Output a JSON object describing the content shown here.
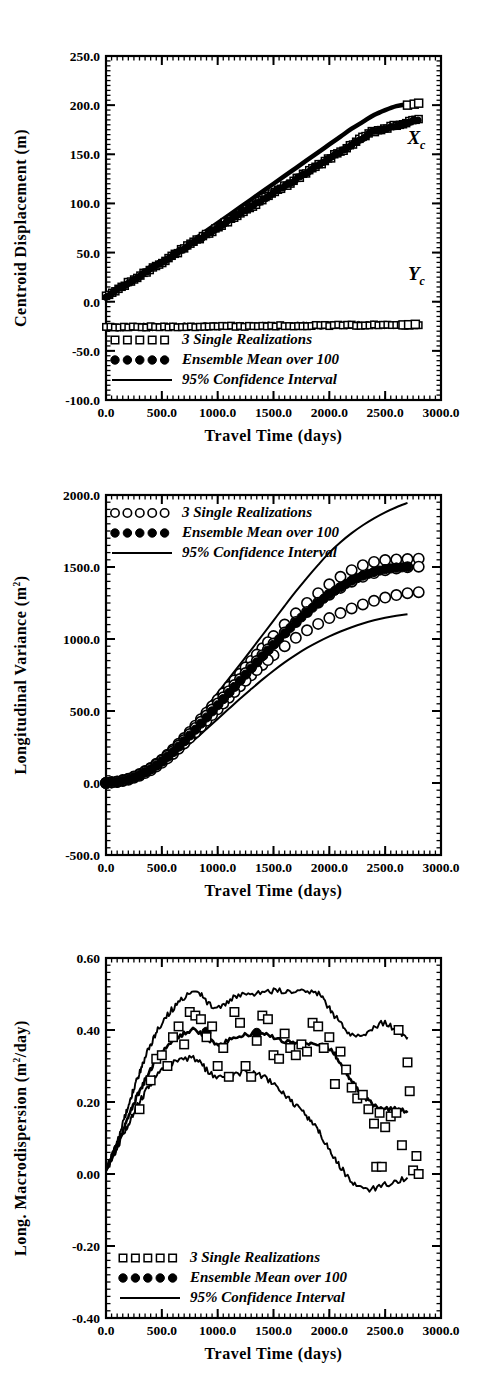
{
  "figure": {
    "background": "#ffffff",
    "ink": "#000000",
    "panel_count": 3
  },
  "legend_common": {
    "items": [
      {
        "label": "3 Single Realizations",
        "marker": "open-square"
      },
      {
        "label": "Ensemble Mean over 100",
        "marker": "filled-circle"
      },
      {
        "label": "95% Confidence Interval",
        "marker": "line"
      }
    ]
  },
  "chart_data": [
    {
      "id": "panel-1",
      "type": "line",
      "title": "",
      "xlabel": "Travel Time (days)",
      "ylabel": "Centroid Displacement (m)",
      "ylabel_parts": {
        "main": "Centroid Displacement (m)"
      },
      "xlim": [
        0,
        3000
      ],
      "ylim": [
        -100,
        250
      ],
      "xticks": [
        0,
        500,
        1000,
        1500,
        2000,
        2500,
        3000
      ],
      "xticklabels": [
        "0.0",
        "500.0",
        "1000.0",
        "1500.0",
        "2000.0",
        "2500.0",
        "3000.0"
      ],
      "yticks": [
        -100,
        -50,
        0,
        50,
        100,
        150,
        200,
        250
      ],
      "yticklabels": [
        "-100.0",
        "-50.0",
        "0.0",
        "50.0",
        "100.0",
        "150.0",
        "200.0",
        "250.0"
      ],
      "xminor_per_interval": 10,
      "yminor_per_interval": 10,
      "grid": false,
      "legend_position": "bottom-left",
      "annotations": [
        {
          "text": "X",
          "sub": "c",
          "x": 2780,
          "y": 160
        },
        {
          "text": "Y",
          "sub": "c",
          "x": 2780,
          "y": 22
        }
      ],
      "series": [
        {
          "name": "Xc Ensemble Mean over 100",
          "marker": "filled-circle",
          "x": [
            0,
            100,
            200,
            300,
            400,
            500,
            600,
            700,
            800,
            900,
            1000,
            1100,
            1200,
            1300,
            1400,
            1500,
            1600,
            1700,
            1800,
            1900,
            2000,
            2100,
            2200,
            2300,
            2400,
            2500,
            2600,
            2700,
            2800
          ],
          "values": [
            5,
            11,
            18,
            25,
            32,
            40,
            48,
            56,
            64,
            72,
            80,
            88,
            96,
            104,
            112,
            120,
            128,
            136,
            144,
            152,
            160,
            168,
            176,
            183,
            190,
            195,
            199,
            201,
            202
          ]
        },
        {
          "name": "Xc 3 Single Realizations",
          "marker": "open-square",
          "x": [
            0,
            100,
            200,
            300,
            400,
            500,
            600,
            700,
            800,
            900,
            1000,
            1100,
            1200,
            1300,
            1400,
            1500,
            1600,
            1700,
            1800,
            1900,
            2000,
            2100,
            2200,
            2300,
            2400,
            2500,
            2600,
            2700,
            2800
          ],
          "values": [
            6,
            12,
            19,
            26,
            33,
            41,
            49,
            57,
            65,
            73,
            81,
            89,
            97,
            105,
            113,
            121,
            129,
            137,
            145,
            153,
            161,
            169,
            177,
            184,
            191,
            196,
            200,
            202,
            203
          ]
        },
        {
          "name": "Yc Ensemble Mean over 100",
          "marker": "filled-circle",
          "x": [
            0,
            200,
            400,
            600,
            800,
            1000,
            1200,
            1400,
            1600,
            1800,
            2000,
            2200,
            2400,
            2600,
            2800
          ],
          "values": [
            -26,
            -26,
            -26,
            -25.5,
            -25.5,
            -25.5,
            -25,
            -25,
            -25,
            -25,
            -24.5,
            -24.5,
            -24,
            -24,
            -23
          ]
        }
      ]
    },
    {
      "id": "panel-2",
      "type": "line",
      "title": "",
      "xlabel": "Travel Time (days)",
      "ylabel": "Longitudinal Variance (m2)",
      "ylabel_parts": {
        "main": "Longitudinal Variance (m",
        "sup": "2",
        "tail": ")"
      },
      "xlim": [
        0,
        3000
      ],
      "ylim": [
        -500,
        2000
      ],
      "xticks": [
        0,
        500,
        1000,
        1500,
        2000,
        2500,
        3000
      ],
      "xticklabels": [
        "0.0",
        "500.0",
        "1000.0",
        "1500.0",
        "2000.0",
        "2500.0",
        "3000.0"
      ],
      "yticks": [
        -500,
        0,
        500,
        1000,
        1500,
        2000
      ],
      "yticklabels": [
        "-500.0",
        "0.0",
        "500.0",
        "1000.0",
        "1500.0",
        "2000.0"
      ],
      "xminor_per_interval": 10,
      "yminor_per_interval": 10,
      "grid": false,
      "legend_position": "top-left",
      "annotations": [],
      "series": [
        {
          "name": "Ensemble Mean over 100",
          "marker": "filled-circle",
          "x": [
            0,
            100,
            200,
            300,
            400,
            500,
            600,
            700,
            800,
            900,
            1000,
            1100,
            1200,
            1300,
            1400,
            1500,
            1600,
            1700,
            1800,
            1900,
            2000,
            2100,
            2200,
            2300,
            2400,
            2500,
            2600,
            2700
          ],
          "values": [
            0,
            8,
            25,
            55,
            95,
            150,
            215,
            290,
            370,
            455,
            540,
            625,
            710,
            795,
            880,
            960,
            1040,
            1115,
            1185,
            1250,
            1310,
            1360,
            1405,
            1440,
            1465,
            1485,
            1495,
            1500
          ]
        },
        {
          "name": "3 Single Realizations",
          "marker": "open-circle",
          "x": [
            0,
            100,
            200,
            300,
            400,
            500,
            600,
            700,
            800,
            900,
            1000,
            1100,
            1200,
            1300,
            1400,
            1500,
            1600,
            1700,
            1800,
            1900,
            2000,
            2100,
            2200,
            2300,
            2400,
            2500,
            2600,
            2700,
            2800
          ],
          "values_a": [
            0,
            10,
            30,
            62,
            105,
            162,
            232,
            312,
            398,
            488,
            578,
            668,
            758,
            848,
            935,
            1020,
            1100,
            1178,
            1250,
            1318,
            1380,
            1432,
            1478,
            1512,
            1535,
            1548,
            1552,
            1555,
            1558
          ],
          "values_b": [
            0,
            7,
            22,
            50,
            88,
            140,
            202,
            275,
            352,
            432,
            512,
            592,
            672,
            748,
            820,
            888,
            950,
            1008,
            1060,
            1105,
            1145,
            1180,
            1212,
            1240,
            1265,
            1288,
            1305,
            1318,
            1325
          ],
          "values_c": [
            0,
            9,
            27,
            58,
            100,
            155,
            222,
            298,
            382,
            468,
            552,
            638,
            722,
            805,
            888,
            968,
            1045,
            1118,
            1188,
            1252,
            1308,
            1355,
            1398,
            1432,
            1458,
            1478,
            1490,
            1498,
            1502
          ]
        },
        {
          "name": "95% Confidence Interval Upper",
          "marker": "line",
          "x": [
            0,
            100,
            200,
            300,
            400,
            500,
            600,
            700,
            800,
            900,
            1000,
            1100,
            1200,
            1300,
            1400,
            1500,
            1600,
            1700,
            1800,
            1900,
            2000,
            2100,
            2200,
            2300,
            2400,
            2500,
            2600,
            2700
          ],
          "values": [
            0,
            12,
            34,
            70,
            118,
            180,
            255,
            340,
            432,
            528,
            626,
            724,
            824,
            924,
            1026,
            1128,
            1230,
            1330,
            1425,
            1515,
            1600,
            1672,
            1735,
            1790,
            1838,
            1880,
            1915,
            1945
          ]
        },
        {
          "name": "95% Confidence Interval Lower",
          "marker": "line",
          "x": [
            0,
            100,
            200,
            300,
            400,
            500,
            600,
            700,
            800,
            900,
            1000,
            1100,
            1200,
            1300,
            1400,
            1500,
            1600,
            1700,
            1800,
            1900,
            2000,
            2100,
            2200,
            2300,
            2400,
            2500,
            2600,
            2700
          ],
          "values": [
            0,
            5,
            18,
            42,
            75,
            120,
            175,
            238,
            305,
            375,
            445,
            515,
            585,
            652,
            718,
            780,
            838,
            890,
            938,
            980,
            1018,
            1052,
            1082,
            1108,
            1130,
            1148,
            1162,
            1172
          ]
        }
      ]
    },
    {
      "id": "panel-3",
      "type": "line",
      "title": "",
      "xlabel": "Travel Time (days)",
      "ylabel": "Long. Macrodispersion (m2/day)",
      "ylabel_parts": {
        "main": "Long. Macrodispersion (m",
        "sup": "2",
        "tail": "/day)"
      },
      "xlim": [
        0,
        3000
      ],
      "ylim": [
        -0.4,
        0.6
      ],
      "xticks": [
        0,
        500,
        1000,
        1500,
        2000,
        2500,
        3000
      ],
      "xticklabels": [
        "0.0",
        "500.0",
        "1000.0",
        "1500.0",
        "2000.0",
        "2500.0",
        "3000.0"
      ],
      "yticks": [
        -0.4,
        -0.2,
        0.0,
        0.2,
        0.4,
        0.6
      ],
      "yticklabels": [
        "-0.40",
        "-0.20",
        "0.00",
        "0.20",
        "0.40",
        "0.60"
      ],
      "xminor_per_interval": 10,
      "yminor_per_interval": 10,
      "grid": false,
      "legend_position": "bottom-left",
      "annotations": [],
      "series": [
        {
          "name": "Ensemble Mean over 100",
          "marker": "filled-circle",
          "x": [
            0,
            100,
            200,
            300,
            400,
            500,
            600,
            700,
            800,
            900,
            1000,
            1100,
            1200,
            1300,
            1400,
            1500,
            1600,
            1700,
            1800,
            1900,
            2000,
            2100,
            2200,
            2300,
            2400,
            2500,
            2600,
            2700
          ],
          "values": [
            0.01,
            0.08,
            0.16,
            0.23,
            0.29,
            0.34,
            0.37,
            0.39,
            0.4,
            0.38,
            0.36,
            0.37,
            0.38,
            0.39,
            0.39,
            0.38,
            0.37,
            0.36,
            0.36,
            0.36,
            0.35,
            0.31,
            0.26,
            0.22,
            0.19,
            0.18,
            0.18,
            0.17
          ]
        },
        {
          "name": "95% Confidence Interval Upper",
          "marker": "line",
          "x": [
            0,
            100,
            200,
            300,
            400,
            500,
            600,
            700,
            800,
            900,
            1000,
            1100,
            1200,
            1300,
            1400,
            1500,
            1600,
            1700,
            1800,
            1900,
            2000,
            2100,
            2200,
            2300,
            2400,
            2500,
            2600,
            2700
          ],
          "values": [
            0.01,
            0.09,
            0.19,
            0.28,
            0.36,
            0.42,
            0.46,
            0.49,
            0.51,
            0.48,
            0.46,
            0.48,
            0.5,
            0.5,
            0.5,
            0.51,
            0.51,
            0.51,
            0.51,
            0.5,
            0.46,
            0.42,
            0.39,
            0.39,
            0.41,
            0.42,
            0.4,
            0.38
          ]
        },
        {
          "name": "95% Confidence Interval Lower",
          "marker": "line",
          "x": [
            0,
            100,
            200,
            300,
            400,
            500,
            600,
            700,
            800,
            900,
            1000,
            1100,
            1200,
            1300,
            1400,
            1500,
            1600,
            1700,
            1800,
            1900,
            2000,
            2100,
            2200,
            2300,
            2400,
            2500,
            2600,
            2700
          ],
          "values": [
            0.01,
            0.07,
            0.14,
            0.2,
            0.25,
            0.29,
            0.31,
            0.32,
            0.32,
            0.29,
            0.27,
            0.27,
            0.28,
            0.28,
            0.27,
            0.25,
            0.22,
            0.19,
            0.16,
            0.12,
            0.07,
            0.02,
            -0.02,
            -0.04,
            -0.04,
            -0.03,
            -0.02,
            -0.01
          ]
        },
        {
          "name": "3 Single Realizations",
          "marker": "open-square",
          "points": [
            [
              300,
              0.18
            ],
            [
              400,
              0.26
            ],
            [
              450,
              0.32
            ],
            [
              500,
              0.33
            ],
            [
              550,
              0.3
            ],
            [
              600,
              0.38
            ],
            [
              650,
              0.41
            ],
            [
              700,
              0.36
            ],
            [
              750,
              0.45
            ],
            [
              800,
              0.44
            ],
            [
              850,
              0.43
            ],
            [
              900,
              0.38
            ],
            [
              950,
              0.41
            ],
            [
              1000,
              0.3
            ],
            [
              1050,
              0.35
            ],
            [
              1100,
              0.27
            ],
            [
              1150,
              0.45
            ],
            [
              1200,
              0.42
            ],
            [
              1250,
              0.3
            ],
            [
              1300,
              0.27
            ],
            [
              1350,
              0.37
            ],
            [
              1400,
              0.44
            ],
            [
              1450,
              0.43
            ],
            [
              1500,
              0.33
            ],
            [
              1550,
              0.32
            ],
            [
              1600,
              0.39
            ],
            [
              1650,
              0.35
            ],
            [
              1700,
              0.33
            ],
            [
              1750,
              0.36
            ],
            [
              1800,
              0.34
            ],
            [
              1850,
              0.42
            ],
            [
              1900,
              0.41
            ],
            [
              1950,
              0.35
            ],
            [
              2000,
              0.38
            ],
            [
              2050,
              0.25
            ],
            [
              2100,
              0.34
            ],
            [
              2150,
              0.29
            ],
            [
              2200,
              0.24
            ],
            [
              2250,
              0.21
            ],
            [
              2300,
              0.22
            ],
            [
              2350,
              0.18
            ],
            [
              2400,
              0.14
            ],
            [
              2450,
              0.17
            ],
            [
              2500,
              0.13
            ],
            [
              2550,
              0.16
            ],
            [
              2600,
              0.17
            ],
            [
              2620,
              0.4
            ],
            [
              2650,
              0.08
            ],
            [
              2700,
              0.31
            ],
            [
              2720,
              0.23
            ],
            [
              2750,
              0.01
            ],
            [
              2780,
              0.05
            ],
            [
              2800,
              0.0
            ],
            [
              2420,
              0.02
            ],
            [
              2470,
              0.02
            ]
          ]
        }
      ]
    }
  ]
}
